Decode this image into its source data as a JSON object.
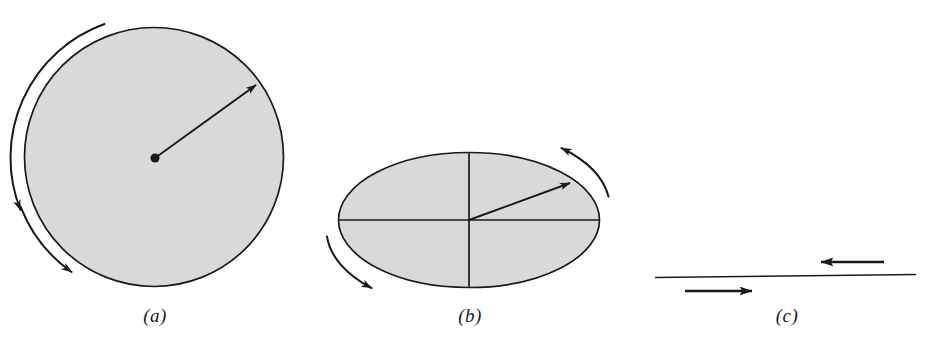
{
  "figure": {
    "background_color": "#ffffff",
    "stroke_color": "#1a1a1a",
    "fill_color": "#d9d9d9",
    "width": 937,
    "height": 346
  },
  "panels": [
    {
      "id": "a",
      "label": "(a)",
      "label_x": 155,
      "label_y": 305,
      "shape": "circle",
      "center": {
        "x": 154,
        "y": 157
      },
      "radius": 130,
      "fill": "#d9d9d9",
      "stroke": "#1a1a1a",
      "stroke_width": 1.6,
      "radius_vector": {
        "from": {
          "x": 155,
          "y": 158
        },
        "to": {
          "x": 257,
          "y": 84
        },
        "hub_dot_radius": 4.5,
        "arrowhead": "solid-triangle"
      },
      "rotation_arcs": [
        {
          "name": "upper-right-rotation-arc",
          "direction": "counterclockwise",
          "arrow_end": "start",
          "start_angle_deg": -70,
          "end_angle_deg": -20,
          "arc_radius": 142
        },
        {
          "name": "lower-left-rotation-arc",
          "direction": "counterclockwise",
          "arrow_end": "end",
          "start_angle_deg": 160,
          "end_angle_deg": 113,
          "arc_radius": 142
        }
      ],
      "diameters": []
    },
    {
      "id": "b",
      "label": "(b)",
      "label_x": 470,
      "label_y": 305,
      "shape": "ellipse",
      "center": {
        "x": 469,
        "y": 220
      },
      "radius_x": 131,
      "radius_y": 68,
      "fill": "#d9d9d9",
      "stroke": "#1a1a1a",
      "stroke_width": 1.6,
      "radius_vector": {
        "from": {
          "x": 469,
          "y": 220
        },
        "to": {
          "x": 571,
          "y": 182
        },
        "hub_dot_radius": 0,
        "arrowhead": "solid-triangle"
      },
      "rotation_arcs": [
        {
          "name": "upper-right-rotation-arc",
          "direction": "counterclockwise",
          "arrow_end": "start",
          "start_angle_deg": -62,
          "end_angle_deg": -12,
          "arc_radius_x": 143,
          "arc_radius_y": 80
        },
        {
          "name": "lower-left-rotation-arc",
          "direction": "counterclockwise",
          "arrow_end": "end",
          "start_angle_deg": 168,
          "end_angle_deg": 118,
          "arc_radius_x": 143,
          "arc_radius_y": 80
        }
      ],
      "diameters": [
        {
          "name": "horizontal-diameter",
          "orientation": "horizontal"
        },
        {
          "name": "vertical-diameter",
          "orientation": "vertical"
        }
      ]
    },
    {
      "id": "c",
      "label": "(c)",
      "label_x": 787,
      "label_y": 305,
      "shape": "line",
      "line": {
        "x1": 655,
        "y1": 277.5,
        "x2": 916,
        "y2": 274.5
      },
      "stroke": "#1a1a1a",
      "stroke_width": 1.6,
      "flow_arrows": [
        {
          "name": "upper-leftward-arrow",
          "direction": "left",
          "tail": {
            "x": 884,
            "y": 262
          },
          "tip": {
            "x": 819,
            "y": 262
          }
        },
        {
          "name": "lower-rightward-arrow",
          "direction": "right",
          "tail": {
            "x": 685,
            "y": 291
          },
          "tip": {
            "x": 754,
            "y": 291
          }
        }
      ]
    }
  ]
}
